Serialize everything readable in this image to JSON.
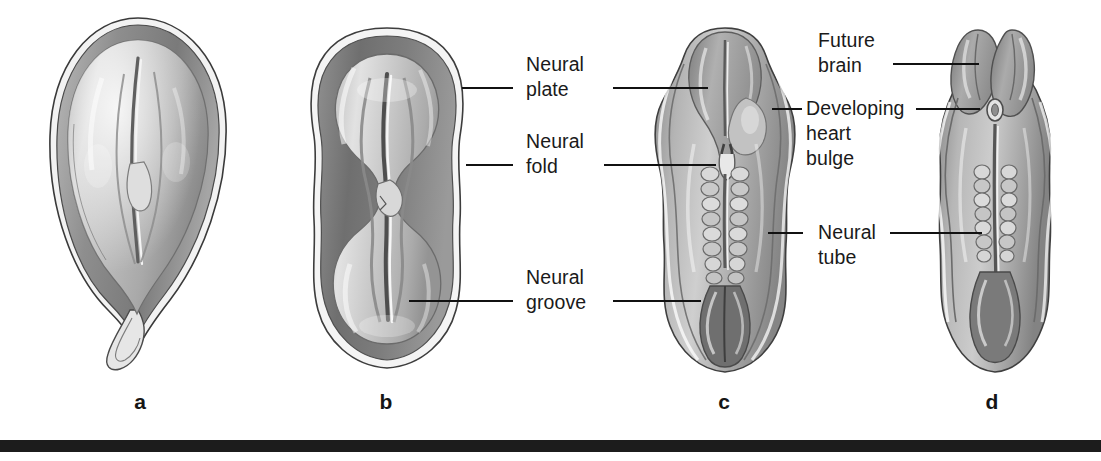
{
  "figure": {
    "background_color": "#ffffff",
    "ink_color": "#1a1a1a",
    "rule_color": "#1c1c1c"
  },
  "panels": [
    {
      "id": "a",
      "letter": "a",
      "caption": "Neural plate stage embryo, dorsal view"
    },
    {
      "id": "b",
      "letter": "b",
      "caption": "Neural folds elevating around the neural groove"
    },
    {
      "id": "c",
      "letter": "c",
      "caption": "Neural folds fusing; somites flank the neural tube"
    },
    {
      "id": "d",
      "letter": "d",
      "caption": "Neural tube closed; future brain enlarged"
    }
  ],
  "labels": [
    {
      "id": "neural-plate",
      "text": "Neural\nplate"
    },
    {
      "id": "neural-fold",
      "text": "Neural\nfold"
    },
    {
      "id": "neural-groove",
      "text": "Neural\ngroove"
    },
    {
      "id": "future-brain",
      "text": "Future\nbrain"
    },
    {
      "id": "developing-heart-bulge",
      "text": "Developing\nheart\nbulge"
    },
    {
      "id": "neural-tube",
      "text": "Neural\ntube"
    }
  ]
}
